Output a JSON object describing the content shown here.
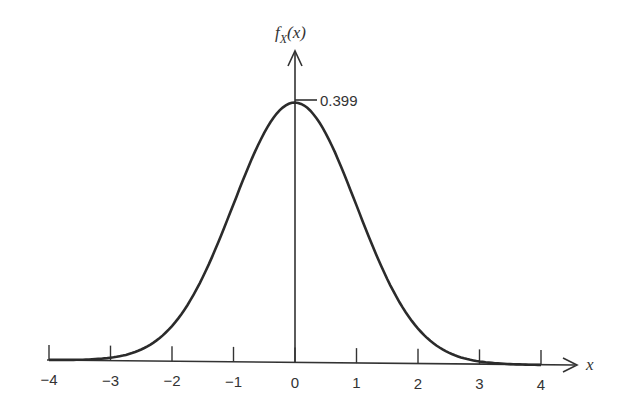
{
  "chart_data": {
    "type": "line",
    "title": "",
    "xlabel": "x",
    "ylabel": "f_X(x)",
    "ylabel_parts": {
      "main": "f",
      "sub": "X",
      "arg": "(x)"
    },
    "xlim": [
      -4,
      4
    ],
    "ylim": [
      0,
      0.399
    ],
    "grid": false,
    "legend": null,
    "x_ticks": [
      -4,
      -3,
      -2,
      -1,
      0,
      1,
      2,
      3,
      4
    ],
    "x_tick_labels": [
      "−4",
      "−3",
      "−2",
      "−1",
      "0",
      "1",
      "2",
      "3",
      "4"
    ],
    "series": [
      {
        "name": "Standard normal PDF",
        "function": "exp(-x^2/2)/sqrt(2*pi)",
        "x": [
          -4,
          -3.5,
          -3,
          -2.5,
          -2,
          -1.5,
          -1,
          -0.5,
          0,
          0.5,
          1,
          1.5,
          2,
          2.5,
          3,
          3.5,
          4
        ],
        "y": [
          0.0001,
          0.0009,
          0.0044,
          0.0175,
          0.054,
          0.1295,
          0.242,
          0.3521,
          0.399,
          0.3521,
          0.242,
          0.1295,
          0.054,
          0.0175,
          0.0044,
          0.0009,
          0.0001
        ]
      }
    ],
    "annotations": [
      {
        "text": "0.399",
        "x": 0,
        "y": 0.399,
        "note": "peak value marker"
      }
    ]
  }
}
